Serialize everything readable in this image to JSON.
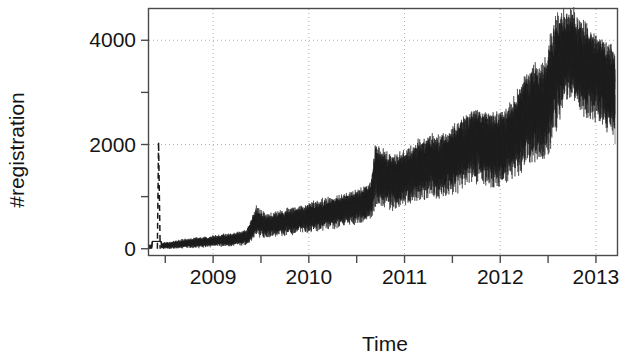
{
  "chart_data": {
    "type": "line",
    "title": "",
    "subtitle": "",
    "xlabel": "Time",
    "ylabel": "#registration",
    "xlim": [
      2008.33,
      2013.22
    ],
    "ylim": [
      -120,
      4600
    ],
    "grid": true,
    "grid_style": "dotted",
    "legend": null,
    "legend_position": "none",
    "x_tick_labels": [
      "2009",
      "2010",
      "2011",
      "2012",
      "2013"
    ],
    "x_tick_values": [
      2009,
      2010,
      2011,
      2012,
      2013
    ],
    "x_minor_ticks": [
      2008.5,
      2009.5,
      2010.5,
      2011.5,
      2012.5
    ],
    "y_tick_labels": [
      "0",
      "2000",
      "4000"
    ],
    "y_tick_values": [
      0,
      2000,
      4000
    ],
    "y_minor_ticks": [
      1000,
      3000
    ],
    "line_color": "#1a1a1a",
    "line_width": 0.6,
    "background": "#ffffff",
    "frame": true,
    "annotations": [
      {
        "label": "initial spike",
        "x": 2008.43,
        "y": 2050
      }
    ],
    "series": [
      {
        "name": "#registration (daily)",
        "x": [
          2008.36,
          2008.43,
          2008.46,
          2008.55,
          2008.65,
          2008.75,
          2008.85,
          2008.95,
          2009.05,
          2009.15,
          2009.25,
          2009.35,
          2009.45,
          2009.5,
          2009.55,
          2009.65,
          2009.75,
          2009.85,
          2009.95,
          2010.05,
          2010.15,
          2010.25,
          2010.35,
          2010.45,
          2010.55,
          2010.65,
          2010.7,
          2010.75,
          2010.8,
          2010.85,
          2010.95,
          2011.05,
          2011.15,
          2011.25,
          2011.3,
          2011.35,
          2011.45,
          2011.55,
          2011.65,
          2011.75,
          2011.85,
          2011.95,
          2012.05,
          2012.15,
          2012.25,
          2012.35,
          2012.45,
          2012.5,
          2012.55,
          2012.65,
          2012.75,
          2012.85,
          2012.95,
          2013.05,
          2013.15,
          2013.2
        ],
        "values": [
          40,
          2050,
          60,
          70,
          95,
          110,
          130,
          140,
          160,
          180,
          200,
          230,
          560,
          520,
          470,
          500,
          540,
          580,
          620,
          660,
          700,
          740,
          790,
          830,
          880,
          1000,
          1580,
          1450,
          1400,
          1380,
          1420,
          1500,
          1600,
          1700,
          1720,
          1680,
          1760,
          1900,
          2050,
          2150,
          2080,
          2020,
          2100,
          2300,
          2600,
          2800,
          2750,
          3050,
          3400,
          3800,
          3900,
          3600,
          3500,
          3400,
          3200,
          3000
        ],
        "band_low": [
          0,
          0,
          10,
          15,
          25,
          35,
          45,
          55,
          65,
          80,
          95,
          110,
          330,
          300,
          280,
          300,
          330,
          360,
          390,
          420,
          450,
          480,
          520,
          560,
          600,
          680,
          1050,
          980,
          940,
          920,
          960,
          1020,
          1100,
          1180,
          1200,
          1160,
          1220,
          1320,
          1450,
          1520,
          1470,
          1420,
          1480,
          1620,
          1850,
          2000,
          1960,
          2150,
          2400,
          2700,
          2780,
          2560,
          2480,
          2400,
          2250,
          2100
        ],
        "band_high": [
          80,
          2050,
          110,
          125,
          165,
          185,
          215,
          225,
          255,
          280,
          305,
          350,
          790,
          740,
          660,
          700,
          750,
          800,
          850,
          900,
          950,
          1000,
          1060,
          1100,
          1160,
          1320,
          2100,
          1920,
          1860,
          1840,
          1880,
          1980,
          2100,
          2220,
          2240,
          2200,
          2300,
          2480,
          2650,
          2780,
          2690,
          2620,
          2720,
          2980,
          3350,
          3600,
          3540,
          3950,
          4300,
          4320,
          4280,
          4100,
          3960,
          3850,
          3700,
          3500
        ]
      }
    ]
  }
}
